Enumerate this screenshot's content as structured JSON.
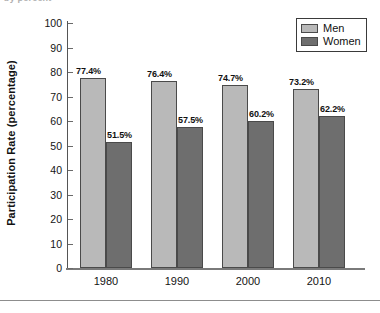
{
  "clipped_caption": "by percent",
  "chart_data": {
    "type": "bar",
    "title": "",
    "subtitle": "",
    "xlabel": "",
    "ylabel": "Participation Rate (percentage)",
    "categories": [
      "1980",
      "1990",
      "2000",
      "2010"
    ],
    "series": [
      {
        "name": "Men",
        "color": "#b9b9b9",
        "values": [
          77.4,
          76.4,
          74.7,
          73.2
        ],
        "labels": [
          "77.4%",
          "76.4%",
          "74.7%",
          "73.2%"
        ]
      },
      {
        "name": "Women",
        "color": "#6e6e6e",
        "values": [
          51.5,
          57.5,
          60.2,
          62.2
        ],
        "labels": [
          "51.5%",
          "57.5%",
          "60.2%",
          "62.2%"
        ]
      }
    ],
    "ylim": [
      0,
      100
    ],
    "ytick_step": 10,
    "yticks": [
      "100",
      "90",
      "80",
      "70",
      "60",
      "50",
      "40",
      "30",
      "20",
      "10",
      "0"
    ],
    "grid": false,
    "legend_position": "top-right",
    "legend": [
      "Men",
      "Women"
    ]
  }
}
